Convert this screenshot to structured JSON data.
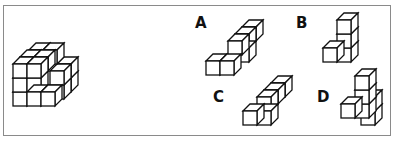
{
  "puzzle": {
    "type": "spatial-reasoning-cube-assembly",
    "main_figure": "cube-assembly",
    "options": [
      {
        "label": "A"
      },
      {
        "label": "B"
      },
      {
        "label": "C"
      },
      {
        "label": "D"
      }
    ]
  }
}
